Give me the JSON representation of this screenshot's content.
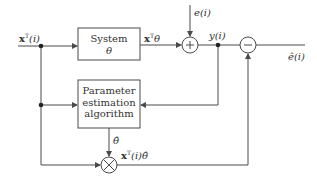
{
  "diagram": {
    "type": "block-diagram",
    "blocks": {
      "system": {
        "line1": "System",
        "line2": "θ"
      },
      "estimator": {
        "line1": "Parameter",
        "line2": "estimation",
        "line3": "algorithm"
      }
    },
    "nodes": {
      "sum": {
        "symbol": "+"
      },
      "subtract": {
        "symbol": "−"
      },
      "multiply": {
        "symbol": "⊗"
      }
    },
    "signals": {
      "input": {
        "bold": "x",
        "sup": "T",
        "rest": "(i)"
      },
      "system_output": {
        "bold": "x",
        "sup": "T",
        "rest": "θ"
      },
      "noise": "e(i)",
      "measured": "y(i)",
      "error": "ê(i)",
      "theta_hat": "θ̂",
      "prediction": {
        "bold": "x",
        "sup": "T",
        "rest": "(i)θ̂"
      }
    },
    "colors": {
      "line": "#4a4a4a",
      "text": "#333333",
      "background": "#ffffff"
    }
  }
}
